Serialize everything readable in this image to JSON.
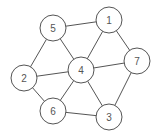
{
  "graph": {
    "nodes": [
      {
        "id": "5",
        "label": "5",
        "x": 53,
        "y": 28
      },
      {
        "id": "1",
        "label": "1",
        "x": 109,
        "y": 20
      },
      {
        "id": "7",
        "label": "7",
        "x": 137,
        "y": 61
      },
      {
        "id": "4",
        "label": "4",
        "x": 81,
        "y": 70
      },
      {
        "id": "2",
        "label": "2",
        "x": 24,
        "y": 78
      },
      {
        "id": "6",
        "label": "6",
        "x": 53,
        "y": 111
      },
      {
        "id": "3",
        "label": "3",
        "x": 109,
        "y": 117
      }
    ],
    "edges": [
      [
        "5",
        "1"
      ],
      [
        "5",
        "2"
      ],
      [
        "5",
        "4"
      ],
      [
        "1",
        "4"
      ],
      [
        "1",
        "7"
      ],
      [
        "4",
        "7"
      ],
      [
        "2",
        "4"
      ],
      [
        "2",
        "6"
      ],
      [
        "4",
        "6"
      ],
      [
        "4",
        "3"
      ],
      [
        "6",
        "3"
      ],
      [
        "7",
        "3"
      ]
    ],
    "node_radius": 13,
    "stroke_color": "#555555"
  }
}
